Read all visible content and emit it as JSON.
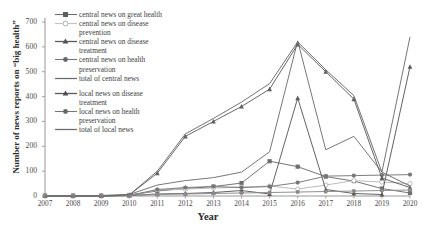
{
  "chart_data": {
    "type": "line",
    "title": "",
    "xlabel": "Year",
    "ylabel": "Number of news reports on \"big health\"",
    "x": [
      2007,
      2008,
      2009,
      2010,
      2011,
      2012,
      2013,
      2014,
      2015,
      2016,
      2017,
      2018,
      2019,
      2020
    ],
    "xlim": [
      2007,
      2020
    ],
    "ylim": [
      0,
      700
    ],
    "yticks": [
      0,
      100,
      200,
      300,
      400,
      500,
      600,
      700
    ],
    "grid": false,
    "legend_position": "upper-left",
    "series": [
      {
        "name": "central news on great health",
        "marker": "square",
        "color": "#6e6e6e",
        "values": [
          2,
          2,
          2,
          4,
          20,
          30,
          38,
          52,
          140,
          118,
          78,
          60,
          30,
          12
        ]
      },
      {
        "name": "central news on disease prevention",
        "marker": "circle-open",
        "color": "#b7b7b7",
        "values": [
          0,
          0,
          0,
          2,
          24,
          28,
          32,
          36,
          40,
          28,
          44,
          62,
          56,
          50
        ]
      },
      {
        "name": "central news on disease treatment",
        "marker": "triangle",
        "color": "#5a5a5a",
        "values": [
          0,
          0,
          0,
          2,
          8,
          10,
          14,
          22,
          8,
          394,
          26,
          10,
          6,
          520
        ]
      },
      {
        "name": "central news on health preservation",
        "marker": "circle",
        "color": "#777777",
        "values": [
          0,
          0,
          0,
          2,
          26,
          34,
          38,
          34,
          38,
          54,
          80,
          82,
          84,
          86
        ]
      },
      {
        "name": "total of central news",
        "marker": "none",
        "color": "#707070",
        "values": [
          2,
          2,
          2,
          6,
          44,
          62,
          74,
          96,
          178,
          624,
          186,
          240,
          96,
          640
        ]
      },
      {
        "name": "local news on disease treatment",
        "marker": "triangle",
        "color": "#606060",
        "values": [
          0,
          0,
          0,
          4,
          92,
          240,
          300,
          360,
          430,
          610,
          500,
          390,
          72,
          34
        ]
      },
      {
        "name": "local news on health preservation",
        "marker": "circle",
        "color": "#8a8a8a",
        "values": [
          0,
          0,
          0,
          2,
          6,
          8,
          10,
          12,
          14,
          16,
          18,
          20,
          22,
          24
        ]
      },
      {
        "name": "total of local news",
        "marker": "none",
        "color": "#6a6a6a",
        "values": [
          0,
          0,
          0,
          4,
          100,
          250,
          312,
          378,
          452,
          620,
          508,
          404,
          96,
          40
        ]
      }
    ]
  },
  "legend": {
    "items": [
      {
        "label_line1": "central news on great health",
        "label_line2": "",
        "marker": "square"
      },
      {
        "label_line1": "central news on disease",
        "label_line2": "prevention",
        "marker": "circle-open"
      },
      {
        "label_line1": "central news on disease",
        "label_line2": "treatment",
        "marker": "triangle"
      },
      {
        "label_line1": "central news on health",
        "label_line2": "preservation",
        "marker": "circle"
      },
      {
        "label_line1": "total of central news",
        "label_line2": "",
        "marker": "line"
      },
      {
        "label_line1": "local news on disease",
        "label_line2": "treatment",
        "marker": "triangle"
      },
      {
        "label_line1": "local news on health",
        "label_line2": "preservation",
        "marker": "circle"
      },
      {
        "label_line1": "total of local news",
        "label_line2": "",
        "marker": "line"
      }
    ]
  },
  "axes": {
    "y_title": "Number of news reports on “big health”",
    "x_title": "Year",
    "y_ticks": [
      "700",
      "600",
      "500",
      "400",
      "300",
      "200",
      "100",
      "0"
    ],
    "x_ticks": [
      "2007",
      "2008",
      "2009",
      "2010",
      "2011",
      "2012",
      "2013",
      "2014",
      "2015",
      "2016",
      "2017",
      "2018",
      "2019",
      "2020"
    ]
  }
}
